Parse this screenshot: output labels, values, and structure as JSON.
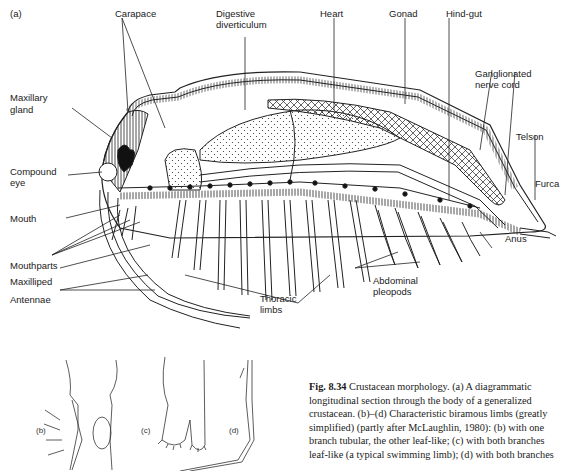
{
  "figure": {
    "panel_label_a": "(a)",
    "panel_label_b": "(b)",
    "panel_label_c": "(c)",
    "panel_label_d": "(d)",
    "labels": {
      "carapace": "Carapace",
      "digestive_1": "Digestive",
      "digestive_2": "diverticulum",
      "heart": "Heart",
      "gonad": "Gonad",
      "hindgut": "Hind-gut",
      "ganglionated_1": "Ganglionated",
      "ganglionated_2": "nerve cord",
      "maxillary_1": "Maxillary",
      "maxillary_2": "gland",
      "telson": "Telson",
      "furca": "Furca",
      "compound_1": "Compound",
      "compound_2": "eye",
      "mouth": "Mouth",
      "anus": "Anus",
      "mouthparts": "Mouthparts",
      "maxilliped": "Maxilliped",
      "antennae": "Antennae",
      "abdominal_1": "Abdominal",
      "abdominal_2": "pleopods",
      "thoracic_1": "Thoracic",
      "thoracic_2": "limbs"
    }
  },
  "caption": {
    "fig_number": "Fig. 8.34",
    "text": " Crustacean morphology. (a) A diagrammatic longitudinal section through the body of a generalized crustacean. (b)–(d) Characteristic biramous limbs (greatly simplified) (partly after McLaughlin, 1980): (b) with one branch tubular, the other leaf-like; (c) with both branches leaf-like (a typical swimming limb); (d) with both branches"
  }
}
